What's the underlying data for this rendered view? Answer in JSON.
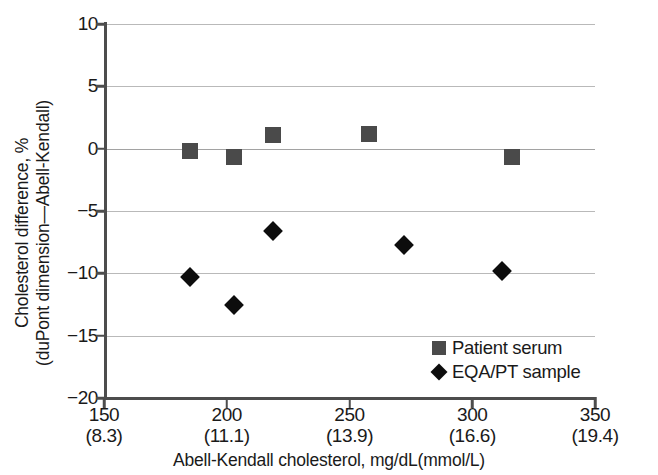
{
  "chart_data": {
    "type": "scatter",
    "title": "",
    "xlabel": "Abell-Kendall cholesterol, mg/dL(mmol/L)",
    "ylabel_line1": "Cholesterol difference, %",
    "ylabel_line2": "(duPont dimension—Abell-Kendall)",
    "xlim": [
      150,
      350
    ],
    "ylim": [
      -20,
      10
    ],
    "grid": true,
    "legend_position": "bottom-right",
    "xticks": [
      {
        "value": 150,
        "label": "150",
        "sublabel": "(8.3)"
      },
      {
        "value": 200,
        "label": "200",
        "sublabel": "(11.1)"
      },
      {
        "value": 250,
        "label": "250",
        "sublabel": "(13.9)"
      },
      {
        "value": 300,
        "label": "300",
        "sublabel": "(16.6)"
      },
      {
        "value": 350,
        "label": "350",
        "sublabel": "(19.4)"
      }
    ],
    "yticks": [
      {
        "value": 10,
        "label": "10"
      },
      {
        "value": 5,
        "label": "5"
      },
      {
        "value": 0,
        "label": "0"
      },
      {
        "value": -5,
        "label": "−5"
      },
      {
        "value": -10,
        "label": "−10"
      },
      {
        "value": -15,
        "label": "−15"
      },
      {
        "value": -20,
        "label": "−20"
      }
    ],
    "series": [
      {
        "name": "Patient serum",
        "marker": "square",
        "color": "#4a4a4a",
        "x": [
          185,
          203,
          219,
          258,
          316
        ],
        "y": [
          -0.2,
          -0.7,
          1.1,
          1.2,
          -0.7
        ]
      },
      {
        "name": "EQA/PT sample",
        "marker": "diamond",
        "color": "#0d0d0d",
        "x": [
          185,
          203,
          219,
          272,
          312
        ],
        "y": [
          -10.3,
          -12.5,
          -6.6,
          -7.7,
          -9.8
        ]
      }
    ]
  },
  "legend": {
    "items": [
      {
        "label": "Patient serum",
        "marker": "square"
      },
      {
        "label": "EQA/PT sample",
        "marker": "diamond"
      }
    ]
  }
}
